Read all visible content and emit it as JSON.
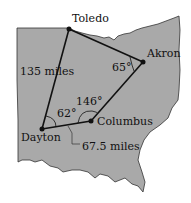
{
  "colors": {
    "state_fill": "#a9a9a9",
    "outline": "#333333",
    "line": "#111111"
  },
  "cities": [
    {
      "name": "Toledo",
      "x": 69,
      "y": 29
    },
    {
      "name": "Akron",
      "x": 143,
      "y": 62
    },
    {
      "name": "Columbus",
      "x": 91,
      "y": 121
    },
    {
      "name": "Dayton",
      "x": 42,
      "y": 129
    }
  ],
  "distances": {
    "toledo_dayton": "135 miles",
    "dayton_columbus": "67.5 miles"
  },
  "angles": {
    "akron": "65°",
    "columbus": "146°",
    "dayton": "62°"
  }
}
